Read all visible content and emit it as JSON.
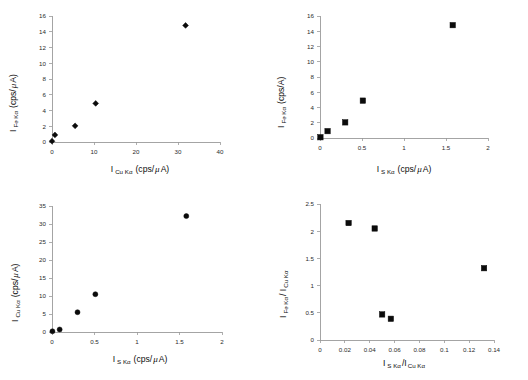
{
  "figure": {
    "panel_count": 4,
    "marker_color": "#0b0b0b",
    "axis_color": "#9a9a9a",
    "background": "#ffffff"
  },
  "chart_data": [
    {
      "type": "scatter",
      "panel": "top-left",
      "title": "",
      "xlabel": "I SKα (cps/ μ A)",
      "xlabel_main": "I",
      "xlabel_sub": "Cu Kα",
      "xlabel_unit_pre": "(cps/",
      "xlabel_unit_mu": "μ",
      "xlabel_unit_post": "A)",
      "ylabel_main": "I",
      "ylabel_sub": "Fe Kα",
      "ylabel_unit_pre": "(cps/",
      "ylabel_unit_mu": "μ",
      "ylabel_unit_post": "A)",
      "xlim": [
        0,
        40
      ],
      "ylim": [
        0,
        16
      ],
      "xticks": [
        0,
        10,
        20,
        30,
        40
      ],
      "yticks": [
        0,
        2,
        4,
        6,
        8,
        10,
        12,
        14,
        16
      ],
      "xticklabels": [
        "0",
        "10",
        "20",
        "30",
        "40"
      ],
      "yticklabels": [
        "0",
        "2",
        "4",
        "6",
        "8",
        "10",
        "12",
        "14",
        "16"
      ],
      "marker": "diamond",
      "grid": false,
      "legend": null,
      "x": [
        0.0,
        0.7,
        5.5,
        10.4,
        31.8
      ],
      "y": [
        0.1,
        0.9,
        2.05,
        4.9,
        14.8
      ]
    },
    {
      "type": "scatter",
      "panel": "top-right",
      "title": "",
      "xlabel_main": "I",
      "xlabel_sub": "S Kα",
      "xlabel_unit_pre": "(cps/",
      "xlabel_unit_mu": "μ",
      "xlabel_unit_post": "A)",
      "ylabel_main": "I",
      "ylabel_sub": "Fe Kα",
      "ylabel_unit_pre": "(cps/A)",
      "ylabel_unit_mu": "",
      "ylabel_unit_post": "",
      "xlim": [
        0,
        2
      ],
      "ylim": [
        0,
        16
      ],
      "xticks": [
        0,
        0.5,
        1,
        1.5,
        2
      ],
      "yticks": [
        0,
        2,
        4,
        6,
        8,
        10,
        12,
        14,
        16
      ],
      "xticklabels": [
        "0",
        "0.5",
        "1",
        "1.5",
        "2"
      ],
      "yticklabels": [
        "0",
        "2",
        "4",
        "6",
        "8",
        "10",
        "12",
        "14",
        "16"
      ],
      "marker": "square",
      "grid": false,
      "legend": null,
      "x": [
        0.005,
        0.09,
        0.3,
        0.51,
        1.58
      ],
      "y": [
        0.1,
        0.9,
        2.05,
        4.9,
        14.8
      ]
    },
    {
      "type": "scatter",
      "panel": "bottom-left",
      "title": "",
      "xlabel_main": "I",
      "xlabel_sub": "S Kα",
      "xlabel_unit_pre": "(cps/",
      "xlabel_unit_mu": "μ",
      "xlabel_unit_post": "A)",
      "ylabel_main": "I",
      "ylabel_sub": "Cu Kα",
      "ylabel_unit_pre": "(cps/",
      "ylabel_unit_mu": "μ",
      "ylabel_unit_post": "A)",
      "xlim": [
        0,
        2
      ],
      "ylim": [
        0,
        35
      ],
      "xticks": [
        0,
        0.5,
        1,
        1.5,
        2
      ],
      "yticks": [
        0,
        5,
        10,
        15,
        20,
        25,
        30,
        35
      ],
      "xticklabels": [
        "0",
        "0.5",
        "1",
        "1.5",
        "2"
      ],
      "yticklabels": [
        "0",
        "5",
        "10",
        "15",
        "20",
        "25",
        "30",
        "35"
      ],
      "marker": "circle",
      "grid": false,
      "legend": null,
      "x": [
        0.005,
        0.09,
        0.3,
        0.51,
        1.58
      ],
      "y": [
        0.2,
        0.7,
        5.5,
        10.5,
        32.2
      ]
    },
    {
      "type": "scatter",
      "panel": "bottom-right",
      "title": "",
      "xlabel_main": "I",
      "xlabel_sub": "S Kα",
      "xlabel_sep": "/I",
      "xlabel_sub2": "Cu Kα",
      "ylabel_main": "I",
      "ylabel_sub": "Fe Kα",
      "ylabel_sep": "/ I",
      "ylabel_sub2": "Cu Kα",
      "xlim": [
        0,
        0.14
      ],
      "ylim": [
        0,
        2.5
      ],
      "xticks": [
        0,
        0.02,
        0.04,
        0.06,
        0.08,
        0.1,
        0.12,
        0.14
      ],
      "yticks": [
        0,
        0.5,
        1,
        1.5,
        2,
        2.5
      ],
      "xticklabels": [
        "0",
        "0.02",
        "0.04",
        "0.06",
        "0.08",
        "0.1",
        "0.12",
        "0.14"
      ],
      "yticklabels": [
        "0",
        "0.5",
        "1",
        "1.5",
        "2",
        "2.5"
      ],
      "marker": "square",
      "grid": false,
      "legend": null,
      "x": [
        0.023,
        0.044,
        0.05,
        0.057,
        0.132
      ],
      "y": [
        2.15,
        2.05,
        0.47,
        0.39,
        1.32
      ]
    }
  ]
}
